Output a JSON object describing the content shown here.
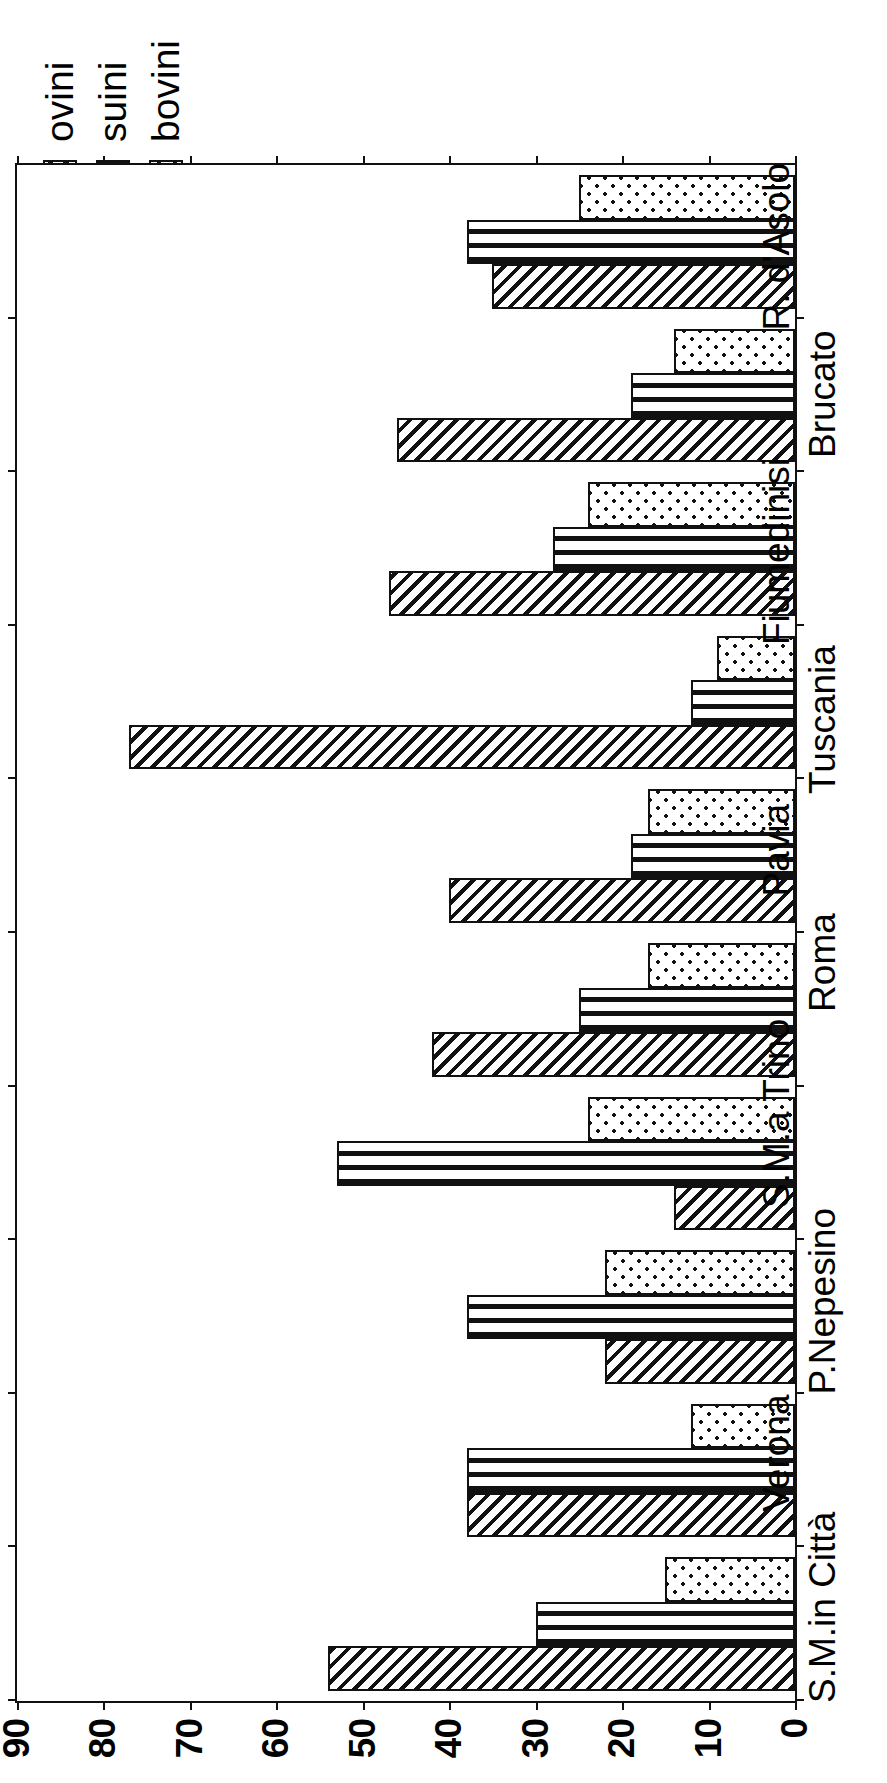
{
  "chart_data": {
    "type": "bar",
    "orientation": "horizontal-rotated",
    "title": "",
    "xlabel": "",
    "ylabel": "",
    "ylim": [
      0,
      90
    ],
    "yticks": [
      0,
      10,
      20,
      30,
      40,
      50,
      60,
      70,
      80,
      90
    ],
    "grid": false,
    "legend_position": "top-right",
    "categories": [
      "S.M.in Città",
      "Verona",
      "P.Nepesino",
      "S.M.a Trino",
      "Roma",
      "Pavia",
      "Tuscania",
      "Fiumedinisi",
      "Brucato",
      "R. d'Asolo"
    ],
    "series": [
      {
        "name": "ovini",
        "values": [
          54,
          38,
          22,
          14,
          42,
          40,
          77,
          47,
          46,
          35
        ]
      },
      {
        "name": "suini",
        "values": [
          30,
          38,
          38,
          53,
          25,
          19,
          12,
          28,
          19,
          38
        ]
      },
      {
        "name": "bovini",
        "values": [
          15,
          12,
          22,
          24,
          17,
          17,
          9,
          24,
          14,
          25
        ]
      }
    ]
  },
  "axis": {
    "tick_labels": [
      "90",
      "80",
      "70",
      "60",
      "50",
      "40",
      "30",
      "20",
      "10",
      "0"
    ]
  },
  "legend": {
    "items": [
      {
        "label": "ovini",
        "pattern": "diagonal-hatch"
      },
      {
        "label": "suini",
        "pattern": "vertical-lines"
      },
      {
        "label": "bovini",
        "pattern": "dots"
      }
    ]
  }
}
